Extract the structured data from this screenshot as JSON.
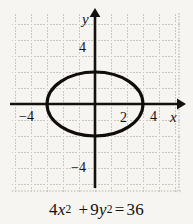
{
  "figure": {
    "background_color": "#f6f5f2",
    "caption": {
      "full_text": "4x² + 9y² = 36",
      "coef_x": "4",
      "var_x": "x",
      "exp_x": "2",
      "plus": "+",
      "coef_y": "9",
      "var_y": "y",
      "exp_y": "2",
      "equals": "=",
      "rhs": "36"
    }
  },
  "chart_data": {
    "type": "line",
    "curve_kind": "ellipse",
    "equation": "4x^2 + 9y^2 = 36",
    "standard_form": "x^2/9 + y^2/4 = 1",
    "center": [
      0,
      0
    ],
    "semi_axis_x": 3,
    "semi_axis_y": 2,
    "x_intercepts": [
      -3,
      3
    ],
    "y_intercepts": [
      -2,
      2
    ],
    "xlabel": "x",
    "ylabel": "y",
    "xlim": [
      -5.2,
      5.3
    ],
    "ylim": [
      -5.7,
      5.7
    ],
    "grid": true,
    "grid_style": "dotted",
    "grid_spacing": 1,
    "legend": "none",
    "x_tick_labels": [
      {
        "value": -4,
        "text": "−4"
      },
      {
        "value": 2,
        "text": "2"
      },
      {
        "value": 4,
        "text": "4"
      }
    ],
    "y_tick_labels": [
      {
        "value": 4,
        "text": "4"
      },
      {
        "value": -4,
        "text": "−4"
      }
    ],
    "axis_arrows": [
      "x-positive",
      "y-positive"
    ],
    "curve_color": "#100d0b",
    "axis_color": "#14110f",
    "grid_color": "#c9c7c0",
    "curve_points": [
      [
        3.0,
        0.0
      ],
      [
        2.9,
        0.51
      ],
      [
        2.6,
        1.0
      ],
      [
        2.12,
        1.41
      ],
      [
        1.5,
        1.73
      ],
      [
        0.78,
        1.93
      ],
      [
        0.0,
        2.0
      ],
      [
        -0.78,
        1.93
      ],
      [
        -1.5,
        1.73
      ],
      [
        -2.12,
        1.41
      ],
      [
        -2.6,
        1.0
      ],
      [
        -2.9,
        0.51
      ],
      [
        -3.0,
        0.0
      ],
      [
        -2.9,
        -0.51
      ],
      [
        -2.6,
        -1.0
      ],
      [
        -2.12,
        -1.41
      ],
      [
        -1.5,
        -1.73
      ],
      [
        -0.78,
        -1.93
      ],
      [
        0.0,
        -2.0
      ],
      [
        0.78,
        -1.93
      ],
      [
        1.5,
        -1.73
      ],
      [
        2.12,
        -1.41
      ],
      [
        2.6,
        -1.0
      ],
      [
        2.9,
        -0.51
      ],
      [
        3.0,
        0.0
      ]
    ]
  }
}
